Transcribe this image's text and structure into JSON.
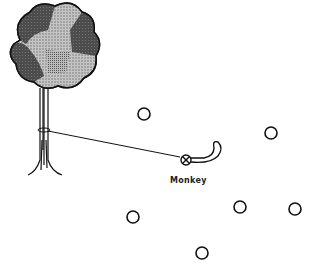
{
  "diagram": {
    "tree": {
      "label": "",
      "trunk_x": 42,
      "canopy_center": [
        52,
        48
      ]
    },
    "monkey": {
      "label": "Monkey",
      "x": 186,
      "y": 156
    },
    "rope": {
      "from": [
        45,
        133
      ],
      "to": [
        180,
        158
      ]
    },
    "circles": [
      {
        "x": 144,
        "y": 114
      },
      {
        "x": 271,
        "y": 133
      },
      {
        "x": 133,
        "y": 217
      },
      {
        "x": 240,
        "y": 207
      },
      {
        "x": 295,
        "y": 209
      },
      {
        "x": 202,
        "y": 253
      }
    ],
    "colors": {
      "dark": "#4a4a4a",
      "mid": "#8a8a8a",
      "light": "#b5b5b5",
      "stroke": "#111111"
    }
  }
}
